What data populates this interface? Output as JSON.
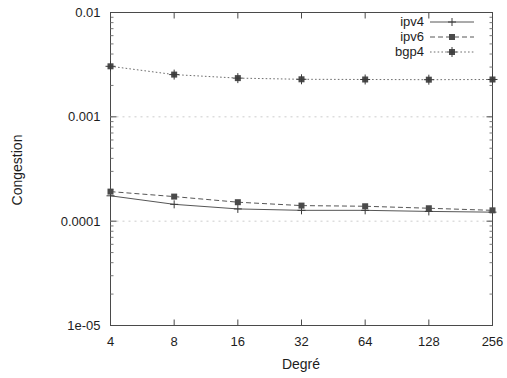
{
  "chart_data": {
    "type": "line",
    "title": "",
    "xlabel": "Degré",
    "ylabel": "Congestion",
    "xscale": "log2",
    "yscale": "log10",
    "x": [
      4,
      8,
      16,
      32,
      64,
      128,
      256
    ],
    "xtick_labels": [
      "4",
      "8",
      "16",
      "32",
      "64",
      "128",
      "256"
    ],
    "ytick_labels": [
      "1e-05",
      "0.0001",
      "0.001",
      "0.01"
    ],
    "ylim": [
      1e-05,
      0.01
    ],
    "xlim": [
      4,
      256
    ],
    "grid": true,
    "legend_position": "top-right",
    "series": [
      {
        "name": "ipv4",
        "style": "solid",
        "marker": "plus",
        "values": [
          0.000175,
          0.000145,
          0.000131,
          0.000127,
          0.000127,
          0.000124,
          0.000122
        ]
      },
      {
        "name": "ipv6",
        "style": "dashed",
        "marker": "square",
        "values": [
          0.000192,
          0.000172,
          0.000152,
          0.000141,
          0.000139,
          0.000133,
          0.000127
        ]
      },
      {
        "name": "bgp4",
        "style": "dotted",
        "marker": "star",
        "values": [
          0.00305,
          0.00254,
          0.00235,
          0.00229,
          0.00228,
          0.00227,
          0.00228
        ]
      }
    ]
  },
  "axes": {
    "y_title": "Congestion",
    "x_title": "Degré"
  },
  "legend": {
    "entries": [
      {
        "label": "ipv4"
      },
      {
        "label": "ipv6"
      },
      {
        "label": "bgp4"
      }
    ]
  },
  "colors": {
    "frame": "#4a4a4a",
    "grid": "#cccccc",
    "series": "#565656",
    "text": "#1d1d1d"
  }
}
